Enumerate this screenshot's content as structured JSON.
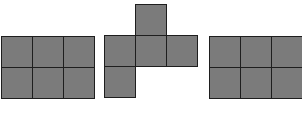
{
  "diagram": {
    "colors": {
      "fill": "#7b7b7b",
      "stroke": "#1e1e1e",
      "background": "#ffffff"
    },
    "cell_size": 31,
    "figures": [
      {
        "id": "figure-1",
        "shape": "2x3 rectangle",
        "origin": [
          1,
          36
        ],
        "cells": [
          [
            0,
            0
          ],
          [
            1,
            0
          ],
          [
            2,
            0
          ],
          [
            0,
            1
          ],
          [
            1,
            1
          ],
          [
            2,
            1
          ]
        ]
      },
      {
        "id": "figure-2",
        "shape": "cube net",
        "origin": [
          104,
          4
        ],
        "cells": [
          [
            1,
            0
          ],
          [
            0,
            1
          ],
          [
            1,
            1
          ],
          [
            2,
            1
          ],
          [
            0,
            2
          ]
        ]
      },
      {
        "id": "figure-3",
        "shape": "2x3 rectangle",
        "origin": [
          209,
          36
        ],
        "cells": [
          [
            0,
            0
          ],
          [
            1,
            0
          ],
          [
            2,
            0
          ],
          [
            0,
            1
          ],
          [
            1,
            1
          ],
          [
            2,
            1
          ]
        ]
      }
    ]
  }
}
